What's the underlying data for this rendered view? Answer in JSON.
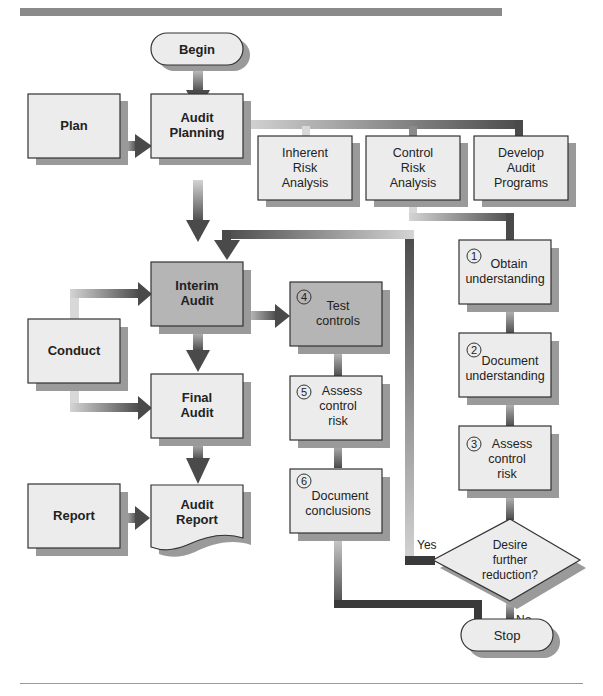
{
  "header": {
    "fragment": ""
  },
  "colors": {
    "box_fill": "#ececec",
    "box_fill_dark": "#b5b5b5",
    "shadow": "#9a9a9a",
    "connector_dark": "#4a4a4a",
    "connector_light": "#d0d0d0",
    "border": "#333333",
    "rule": "#8a8a8a"
  },
  "nodes": {
    "begin": {
      "label": [
        "Begin"
      ]
    },
    "plan": {
      "label": [
        "Plan"
      ]
    },
    "audit_planning": {
      "label": [
        "Audit",
        "Planning"
      ]
    },
    "inherent_risk": {
      "label": [
        "Inherent",
        "Risk",
        "Analysis"
      ]
    },
    "control_risk": {
      "label": [
        "Control",
        "Risk",
        "Analysis"
      ]
    },
    "develop_programs": {
      "label": [
        "Develop",
        "Audit",
        "Programs"
      ]
    },
    "conduct": {
      "label": [
        "Conduct"
      ]
    },
    "interim_audit": {
      "label": [
        "Interim",
        "Audit"
      ]
    },
    "final_audit": {
      "label": [
        "Final",
        "Audit"
      ]
    },
    "report": {
      "label": [
        "Report"
      ]
    },
    "audit_report": {
      "label": [
        "Audit",
        "Report"
      ]
    },
    "step1": {
      "num": "1",
      "label": [
        "Obtain",
        "understanding"
      ]
    },
    "step2": {
      "num": "2",
      "label": [
        "Document",
        "understanding"
      ]
    },
    "step3": {
      "num": "3",
      "label": [
        "Assess",
        "control",
        "risk"
      ]
    },
    "step4": {
      "num": "4",
      "label": [
        "Test",
        "controls"
      ]
    },
    "step5": {
      "num": "5",
      "label": [
        "Assess",
        "control",
        "risk"
      ]
    },
    "step6": {
      "num": "6",
      "label": [
        "Document",
        "conclusions"
      ]
    },
    "decision": {
      "label": [
        "Desire",
        "further",
        "reduction?"
      ]
    },
    "stop": {
      "label": [
        "Stop"
      ]
    }
  },
  "edge_labels": {
    "yes": "Yes",
    "no": "No"
  }
}
